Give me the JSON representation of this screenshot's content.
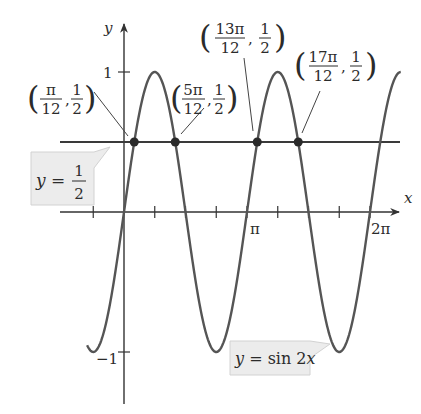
{
  "chart_data": {
    "type": "line",
    "title": "",
    "xlabel": "x",
    "ylabel": "y",
    "xlim_pi": [
      -0.3,
      2.25
    ],
    "ylim": [
      -1.35,
      1.35
    ],
    "grid": false,
    "x_ticks_pi": [
      -0.25,
      0.25,
      0.5,
      0.75,
      1.0,
      1.25,
      1.5,
      1.75,
      2.0
    ],
    "x_tick_labels": [
      {
        "at_pi": 1.0,
        "label": "π"
      },
      {
        "at_pi": 2.0,
        "label": "2π"
      }
    ],
    "y_ticks": [
      1,
      -1
    ],
    "y_tick_labels": [
      {
        "at": 1,
        "label": "1"
      },
      {
        "at": -1,
        "label": "−1"
      }
    ],
    "series": [
      {
        "name": "y = sin 2x",
        "function": "sin(2x)",
        "x_range_pi": [
          -0.3,
          2.25
        ],
        "color": "#555555"
      },
      {
        "name": "y = 1/2",
        "function": "0.5",
        "x_range_pi": [
          -0.52,
          2.25
        ],
        "color": "#3a3a3a"
      }
    ],
    "intersection_points": [
      {
        "x_pi_num": 1,
        "x_den": 12,
        "y_num": 1,
        "y_den": 2,
        "x_text": "π",
        "label": "(π/12, 1/2)"
      },
      {
        "x_pi_num": 5,
        "x_den": 12,
        "y_num": 1,
        "y_den": 2,
        "x_text": "5π",
        "label": "(5π/12, 1/2)"
      },
      {
        "x_pi_num": 13,
        "x_den": 12,
        "y_num": 1,
        "y_den": 2,
        "x_text": "13π",
        "label": "(13π/12, 1/2)"
      },
      {
        "x_pi_num": 17,
        "x_den": 12,
        "y_num": 1,
        "y_den": 2,
        "x_text": "17π",
        "label": "(17π/12, 1/2)"
      }
    ],
    "annotations": [
      {
        "text": "y = 1/2",
        "type": "callout-box"
      },
      {
        "text": "y = sin 2x",
        "type": "callout-box"
      }
    ]
  },
  "labels": {
    "x_axis": "x",
    "y_axis": "y",
    "tick_pi": "π",
    "tick_2pi": "2π",
    "tick_1": "1",
    "tick_neg1": "−1",
    "den": "12",
    "half_num": "1",
    "half_den": "2",
    "callout_half_lhs": "y =",
    "callout_half_num": "1",
    "callout_half_den": "2",
    "callout_sin": "y = sin 2x",
    "p1_num": "π",
    "p2_num": "5π",
    "p3_num": "13π",
    "p4_num": "17π"
  },
  "colors": {
    "curve": "#555555",
    "line": "#3a3a3a",
    "axis": "#333333",
    "dot": "#2a2a2a",
    "callout_fill": "#ececec",
    "callout_edge": "#cfcfcf"
  }
}
